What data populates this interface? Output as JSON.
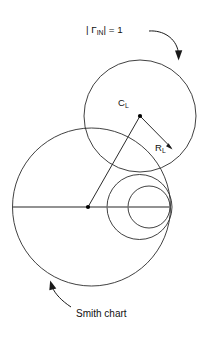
{
  "figure": {
    "type": "smith-chart-stability-diagram",
    "background_color": "#ffffff",
    "width": 202,
    "height": 340,
    "labels": {
      "gamma_prefix": "| ",
      "gamma_symbol": "Γ",
      "gamma_subscript": "IN",
      "gamma_suffix": "| = 1",
      "gamma_full": "| ΓIN| = 1",
      "center_label": "C",
      "center_subscript": "L",
      "radius_label": "R",
      "radius_subscript": "L",
      "smith_chart_label": "Smith chart"
    },
    "colors": {
      "curve": "#2b2b2b",
      "axis": "#6e6e6e",
      "annotation": "#1a1a1a",
      "text": "#111111",
      "marker": "#000000"
    },
    "geometry": {
      "stability_circle": {
        "cx": 140,
        "cy": 116,
        "r": 56,
        "name": "load-stability-circle"
      },
      "smith_outer_circle": {
        "cx": 91.5,
        "cy": 207,
        "r": 79,
        "name": "smith-chart-outer-circle"
      },
      "medium_circle": {
        "cx": 139.5,
        "cy": 207,
        "r": 32.5,
        "name": "constant-resistance-circle-medium"
      },
      "small_circle": {
        "cx": 149,
        "cy": 207,
        "r": 21,
        "name": "constant-resistance-circle-small"
      },
      "real_axis": {
        "x1": 13,
        "y1": 207,
        "x2": 170,
        "y2": 207,
        "name": "real-axis-line"
      },
      "origin_marker": {
        "cx": 88,
        "cy": 207,
        "r": 2.0,
        "name": "smith-chart-origin-dot"
      },
      "center_marker": {
        "cx": 140,
        "cy": 116,
        "r": 2.0,
        "name": "stability-circle-center-dot"
      },
      "radius_vector": {
        "x1": 140,
        "y1": 116,
        "x2": 172,
        "y2": 149,
        "name": "radius-vector-RL"
      },
      "center_vector": {
        "x1": 88,
        "y1": 207,
        "x2": 140,
        "y2": 116,
        "name": "center-vector-CL"
      }
    },
    "annotations": {
      "gamma_leader": {
        "name": "gamma-leader-arrow",
        "path": "M 149 31 C 163 30 175 38 178 52",
        "arrow_tip": {
          "x": 178.5,
          "y": 60
        }
      },
      "smith_leader": {
        "name": "smith-chart-leader-arrow",
        "path": "M 70 306 C 62 300 56 294 53 288",
        "arrow_tip": {
          "x": 51,
          "y": 281
        }
      }
    },
    "text_positions": {
      "gamma": {
        "x": 86,
        "y": 33
      },
      "center": {
        "x": 118,
        "y": 106
      },
      "radius": {
        "x": 156,
        "y": 151
      },
      "smith": {
        "x": 76,
        "y": 316
      }
    }
  }
}
